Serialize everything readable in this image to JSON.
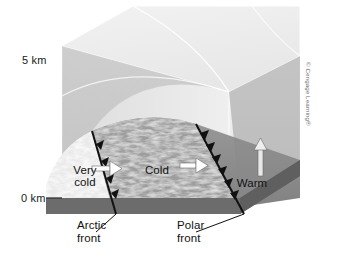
{
  "figure": {
    "type": "3d-block-diagram",
    "background_color": "#ffffff"
  },
  "axis": {
    "name": "altitude",
    "unit": "km",
    "ticks": [
      {
        "value": "5 km",
        "y_px": 60
      },
      {
        "value": "0 km",
        "y_px": 198
      }
    ],
    "top_label": "5 km",
    "bottom_label": "0 km"
  },
  "air_masses": [
    {
      "id": "very-cold",
      "label": "Very\ncold",
      "label_text": "Very cold",
      "fill": "#f2f2f2",
      "arrow": "right"
    },
    {
      "id": "cold",
      "label": "Cold",
      "label_text": "Cold",
      "fill": "#9a9a9a",
      "arrow": "right"
    },
    {
      "id": "warm",
      "label": "Warm",
      "label_text": "Warm",
      "fill": "#8d8d8d",
      "arrow": "up"
    }
  ],
  "fronts": [
    {
      "id": "arctic-front",
      "label": "Arctic\nfront",
      "label_text": "Arctic front",
      "symbol": "cold-front-triangles",
      "color": "#111111"
    },
    {
      "id": "polar-front",
      "label": "Polar\nfront",
      "label_text": "Polar front",
      "symbol": "cold-front-triangles",
      "color": "#111111"
    }
  ],
  "colors": {
    "sky_top": "#ececec",
    "sky_upper": "#e2e2e2",
    "cube_top_face": "#f0f0f0",
    "cube_side_face": "#e6e6e6",
    "cold_wedge": "#9b9b9b",
    "dome_shade": "#b4b4b4",
    "ground_band": "#6e6e6e",
    "ground_base": "#5f5f5f",
    "front_line": "#111111",
    "text": "#1a1a1a",
    "copyright_text": "#6a6a6a",
    "guide_line": "#ffffff"
  },
  "credit": {
    "text": "© Cengage Learning®",
    "orientation": "vertical"
  }
}
